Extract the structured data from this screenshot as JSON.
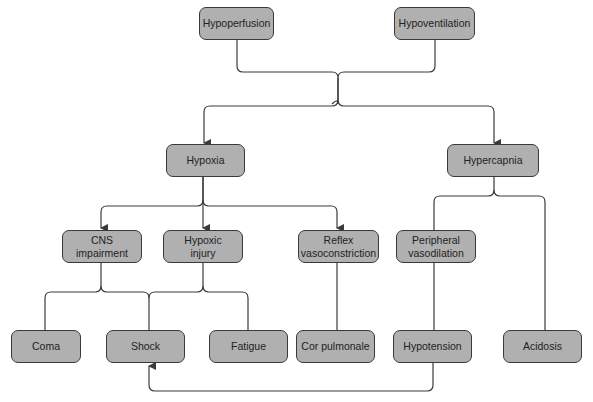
{
  "diagram": {
    "title": "",
    "nodes": {
      "hypoperfusion": "Hypoperfusion",
      "hypoventilation": "Hypoventilation",
      "hypoxia": "Hypoxia",
      "hypercapnia": "Hypercapnia",
      "cns_impairment": "CNS\nimpairment",
      "hypoxic_injury": "Hypoxic\ninjury",
      "reflex_vasoconstriction": "Reflex\nvasoconstriction",
      "peripheral_vasodilation": "Peripheral\nvasodilation",
      "coma": "Coma",
      "shock": "Shock",
      "fatigue": "Fatigue",
      "cor_pulmonale": "Cor pulmonale",
      "hypotension": "Hypotension",
      "acidosis": "Acidosis"
    },
    "edges": [
      {
        "from": "Hypoperfusion",
        "to": "Hypoxia"
      },
      {
        "from": "Hypoperfusion",
        "to": "Hypercapnia"
      },
      {
        "from": "Hypoventilation",
        "to": "Hypoxia"
      },
      {
        "from": "Hypoventilation",
        "to": "Hypercapnia"
      },
      {
        "from": "Hypoxia",
        "to": "CNS impairment"
      },
      {
        "from": "Hypoxia",
        "to": "Hypoxic injury"
      },
      {
        "from": "Hypoxia",
        "to": "Reflex vasoconstriction"
      },
      {
        "from": "Hypercapnia",
        "to": "Peripheral vasodilation"
      },
      {
        "from": "Hypercapnia",
        "to": "Acidosis"
      },
      {
        "from": "CNS impairment",
        "to": "Coma"
      },
      {
        "from": "CNS impairment",
        "to": "Shock"
      },
      {
        "from": "CNS impairment",
        "to": "Fatigue"
      },
      {
        "from": "Hypoxic injury",
        "to": "Coma"
      },
      {
        "from": "Hypoxic injury",
        "to": "Shock"
      },
      {
        "from": "Hypoxic injury",
        "to": "Fatigue"
      },
      {
        "from": "Reflex vasoconstriction",
        "to": "Cor pulmonale"
      },
      {
        "from": "Peripheral vasodilation",
        "to": "Hypotension"
      },
      {
        "from": "Hypotension",
        "to": "Shock"
      }
    ],
    "colors": {
      "node_fill": "#b0b0b0",
      "node_border": "#3a3a3a",
      "edge": "#3a3a3a",
      "background": "#ffffff"
    }
  }
}
